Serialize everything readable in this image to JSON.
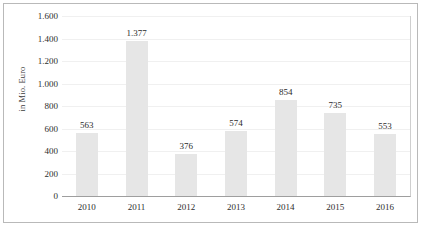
{
  "chart_data": {
    "type": "bar",
    "title": "",
    "subtitle": "",
    "xlabel": "",
    "ylabel": "in Mio. Euro",
    "categories": [
      "2010",
      "2011",
      "2012",
      "2013",
      "2014",
      "2015",
      "2016"
    ],
    "values": [
      563,
      1377,
      376,
      574,
      854,
      735,
      553
    ],
    "value_labels": [
      "563",
      "1.377",
      "376",
      "574",
      "854",
      "735",
      "553"
    ],
    "series": [
      {
        "name": "",
        "values": [
          563,
          1377,
          376,
          574,
          854,
          735,
          553
        ]
      }
    ],
    "ylim": [
      0,
      1600
    ],
    "ytick_values": [
      0,
      200,
      400,
      600,
      800,
      1000,
      1200,
      1400,
      1600
    ],
    "ytick_labels": [
      "0",
      "200",
      "400",
      "600",
      "800",
      "1.000",
      "1.200",
      "1.400",
      "1.600"
    ],
    "grid": true,
    "grid_axis": "y",
    "legend": false,
    "legend_position": "none",
    "number_format": "de-DE thousands separator is period",
    "bar_color": "#e6e6e6",
    "gridline_color": "#f0f0f0",
    "axis_color": "#9e9e9e",
    "text_color": "#2e2e2e",
    "frame_border_color": "#b9b9b9",
    "background_color": "#ffffff"
  }
}
